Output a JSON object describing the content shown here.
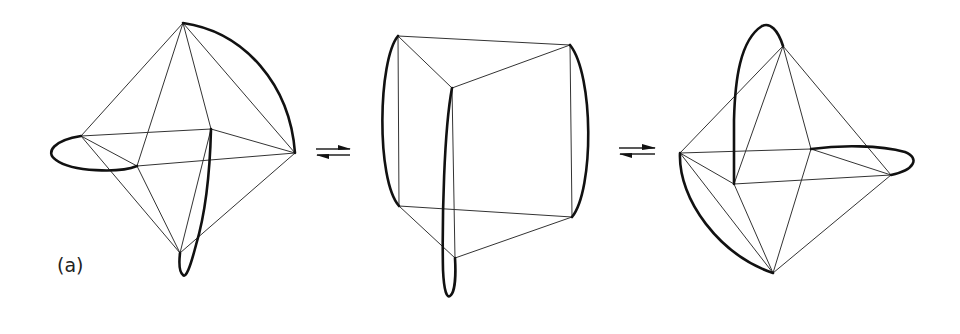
{
  "figure": {
    "panel_label": "(a)",
    "stages": [
      {
        "name": "left-octahedron",
        "shape": "octahedron"
      },
      {
        "name": "center-trigonal-prism",
        "shape": "trigonal prism"
      },
      {
        "name": "right-octahedron",
        "shape": "octahedron"
      }
    ],
    "equilibrium_arrows": [
      {
        "name": "equilibrium-arrow-1",
        "symbol": "⇌"
      },
      {
        "name": "equilibrium-arrow-2",
        "symbol": "⇌"
      }
    ],
    "colors": {
      "background": "#ffffff",
      "thin_edge": "#333333",
      "bold_loop": "#111111"
    }
  }
}
